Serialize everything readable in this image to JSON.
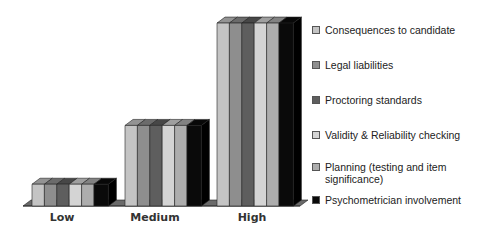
{
  "chart_data": {
    "type": "bar",
    "style": "3d-clustered",
    "title": "",
    "xlabel": "",
    "ylabel": "",
    "categories": [
      "Low",
      "Medium",
      "High"
    ],
    "series": [
      {
        "name": "Consequences to candidate",
        "color": "#c4c4c4",
        "values": [
          10,
          37,
          84
        ]
      },
      {
        "name": "Legal liabilities",
        "color": "#8e8e8e",
        "values": [
          10,
          37,
          84
        ]
      },
      {
        "name": "Proctoring standards",
        "color": "#5e5e5e",
        "values": [
          10,
          37,
          84
        ]
      },
      {
        "name": "Validity & Reliability checking",
        "color": "#d4d4d4",
        "values": [
          10,
          37,
          84
        ]
      },
      {
        "name": "Planning (testing and item significance)",
        "color": "#adadad",
        "values": [
          10,
          37,
          84
        ]
      },
      {
        "name": "Psychometrician involvement",
        "color": "#0a0a0a",
        "values": [
          10,
          37,
          84
        ]
      }
    ],
    "ylim": [
      0,
      90
    ],
    "grid": false,
    "axis_ticks_shown": false,
    "legend_position": "right"
  },
  "legend": {
    "items": [
      {
        "label": "Consequences to candidate",
        "color": "#c4c4c4"
      },
      {
        "label": "Legal liabilities",
        "color": "#8e8e8e"
      },
      {
        "label": "Proctoring standards",
        "color": "#5e5e5e"
      },
      {
        "label": "Validity & Reliability checking",
        "color": "#d4d4d4"
      },
      {
        "label": "Planning (testing and item significance)",
        "color": "#adadad"
      },
      {
        "label": "Psychometrician involvement",
        "color": "#0a0a0a"
      }
    ]
  },
  "axis": {
    "categories": [
      "Low",
      "Medium",
      "High"
    ]
  }
}
